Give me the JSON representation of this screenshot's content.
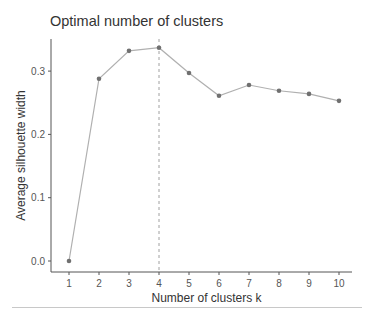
{
  "chart_data": {
    "type": "line",
    "title": "Optimal number of clusters",
    "xlabel": "Number of clusters k",
    "ylabel": "Average silhouette width",
    "categories": [
      "1",
      "2",
      "3",
      "4",
      "5",
      "6",
      "7",
      "8",
      "9",
      "10"
    ],
    "x": [
      1,
      2,
      3,
      4,
      5,
      6,
      7,
      8,
      9,
      10
    ],
    "values": [
      0.0,
      0.288,
      0.332,
      0.337,
      0.297,
      0.261,
      0.278,
      0.269,
      0.264,
      0.253
    ],
    "yticks": [
      "0.0",
      "0.1",
      "0.2",
      "0.3"
    ],
    "ylim": [
      -0.017,
      0.35
    ],
    "optimal_k": 4,
    "optimal_marker": "dashed vertical line at k=4",
    "grid": false,
    "legend": "none",
    "colors": {
      "line": "#b0b0b0",
      "points": "#707070",
      "axis": "#555555",
      "vline": "#a0a0a0"
    }
  }
}
